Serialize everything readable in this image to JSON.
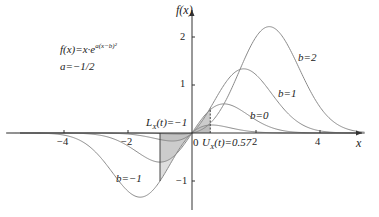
{
  "chart_data": {
    "type": "line",
    "title": "",
    "formula": "f(x)=x·e^{a(x−b)^2}",
    "formula_label": "f(x)=x·e",
    "formula_exp": "a(x−b)²",
    "param_label": "a=−1/2",
    "a": -0.5,
    "xlabel": "x",
    "ylabel": "f(x)",
    "xlim": [
      -5.8,
      6.1
    ],
    "ylim": [
      -1.7,
      2.55
    ],
    "x_ticks": [
      -4,
      -2,
      2,
      4
    ],
    "x_tick_labels": [
      "−4",
      "−2",
      "2",
      "4"
    ],
    "y_ticks": [
      2,
      1,
      -1
    ],
    "y_tick_labels": [
      "2",
      "1",
      "−1"
    ],
    "origin_label": "0",
    "series": [
      {
        "name": "b=2",
        "b": 2,
        "label": "b=2",
        "label_x": 3.45,
        "label_y": 1.85
      },
      {
        "name": "b=1",
        "b": 1,
        "label": "b=1",
        "label_x": 2.55,
        "label_y": 1.05
      },
      {
        "name": "b=0",
        "b": 0,
        "label": "b=0",
        "label_x": 1.4,
        "label_y": 0.35
      },
      {
        "name": "b=-1",
        "b": -1,
        "label": "b=−1",
        "label_x": -2.6,
        "label_y": -0.65
      }
    ],
    "annotations": [
      {
        "text": "L_X(t)=−1",
        "x": -1,
        "type": "lower-bound"
      },
      {
        "text": "U_X(t)=0.57",
        "x": 0.57,
        "type": "upper-bound"
      }
    ],
    "shaded_interval": [
      -1,
      0.57
    ],
    "grid": false,
    "legend": "inline labels"
  },
  "labels": {
    "f_label": "f(x)",
    "x_label": "x",
    "formula_main": "f(x)=x·e",
    "formula_exp": "a(x−b)²",
    "param": "a=−1/2",
    "L_text_main": "L",
    "L_sub": "X",
    "L_rest": "(t)=−1",
    "U_text_main": "U",
    "U_sub": "X",
    "U_rest": "(t)=0.57",
    "origin": "0",
    "tick_m4": "−4",
    "tick_m2": "−2",
    "tick_2": "2",
    "tick_4": "4",
    "ytick_2": "2",
    "ytick_1": "1",
    "ytick_m1": "−1",
    "b2": "b=2",
    "b1": "b=1",
    "b0": "b=0",
    "bm1": "b=−1"
  },
  "colors": {
    "curve": "#8a8a8a",
    "axis": "#333333",
    "shade": "#b5b5b5",
    "text": "#222222"
  }
}
